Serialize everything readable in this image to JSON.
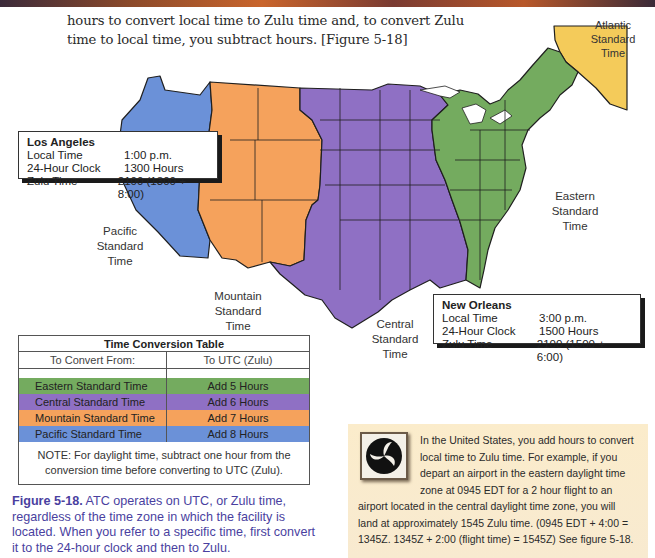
{
  "intro": {
    "text": "hours to convert local time to Zulu time and, to convert Zulu time to local time, you subtract hours. [Figure 5-18]"
  },
  "map": {
    "colors": {
      "eastern": "#74ab5f",
      "central": "#8f70c4",
      "mountain": "#f5a25c",
      "pacific": "#6b91d8",
      "atlantic": "#f4cb5a",
      "border": "#1f1f1f"
    },
    "zone_labels": {
      "atlantic": [
        "Atlantic",
        "Standard",
        "Time"
      ],
      "pacific": [
        "Pacific",
        "Standard",
        "Time"
      ],
      "mountain": [
        "Mountain",
        "Standard",
        "Time"
      ],
      "central": [
        "Central",
        "Standard",
        "Time"
      ],
      "eastern": [
        "Eastern",
        "Standard",
        "Time"
      ]
    }
  },
  "los_angeles": {
    "city": "Los Angeles",
    "rows": [
      {
        "label": "Local Time",
        "value": "1:00 p.m."
      },
      {
        "label": "24-Hour Clock",
        "value": "1300 Hours"
      },
      {
        "label": "Zulu Time",
        "value": "2100 (1300 + 8:00)"
      }
    ]
  },
  "new_orleans": {
    "city": "New Orleans",
    "rows": [
      {
        "label": "Local Time",
        "value": "3:00 p.m."
      },
      {
        "label": "24-Hour Clock",
        "value": "1500 Hours"
      },
      {
        "label": "Zulu Time",
        "value": "2100 (1500 + 6:00)"
      }
    ]
  },
  "conversion_table": {
    "title": "Time Conversion Table",
    "headers": [
      "To Convert From:",
      "To UTC (Zulu)"
    ],
    "rows": [
      {
        "zone": "Eastern Standard Time",
        "offset": "Add 5 Hours",
        "color": "#74ab5f"
      },
      {
        "zone": "Central Standard Time",
        "offset": "Add 6 Hours",
        "color": "#8f70c4"
      },
      {
        "zone": "Mountain Standard Time",
        "offset": "Add 7 Hours",
        "color": "#f5a25c"
      },
      {
        "zone": "Pacific Standard Time",
        "offset": "Add 8 Hours",
        "color": "#6b91d8"
      }
    ],
    "note": "NOTE: For daylight time, subtract one hour from the conversion time before converting to UTC (Zulu)."
  },
  "caption": {
    "label": "Figure 5-18.",
    "text": " ATC operates on UTC, or Zulu time, regardless of the time zone in which the facility is located. When you refer to a specific time, first convert it to the 24-hour clock and then to Zulu."
  },
  "sidebar": {
    "icon": "dot-triskelion-logo",
    "text": "In the United States, you add hours to convert local time to Zulu time. For example, if you depart an airport in the eastern daylight time zone at 0945 EDT for a 2 hour flight to an airport located in the central daylight time zone, you will land at approximately 1545 Zulu time. (0945 EDT + 4:00 = 1345Z. 1345Z + 2:00 (flight time) = 1545Z) See figure 5-18."
  }
}
